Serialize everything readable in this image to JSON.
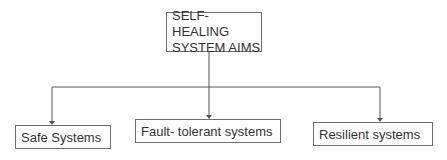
{
  "diagram": {
    "root": {
      "line1": "SELF- HEALING",
      "line2": "SYSTEM AIMS"
    },
    "children": [
      {
        "label": "Safe Systems"
      },
      {
        "label": "Fault- tolerant systems"
      },
      {
        "label": "Resilient systems"
      }
    ],
    "colors": {
      "line": "#555555",
      "box_border": "#6e6e6e",
      "text": "#333333"
    }
  }
}
